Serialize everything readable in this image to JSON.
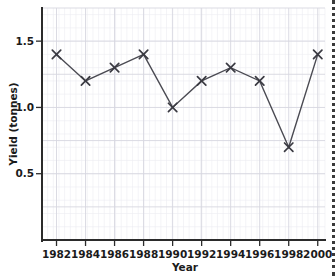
{
  "chart_data": {
    "type": "line",
    "title": "",
    "xlabel": "Year",
    "ylabel": "Yield (tonnes)",
    "x": [
      1982,
      1984,
      1986,
      1988,
      1990,
      1992,
      1994,
      1996,
      1998,
      2000
    ],
    "values": [
      1.4,
      1.2,
      1.3,
      1.4,
      1.0,
      1.2,
      1.3,
      1.2,
      0.7,
      1.4
    ],
    "xtick_labels": [
      "1982",
      "1984",
      "1986",
      "1988",
      "1990",
      "1992",
      "1994",
      "1996",
      "1998",
      "2000"
    ],
    "ytick_labels": [
      "0.5",
      "1.0",
      "1.5"
    ],
    "ytick_values": [
      0.5,
      1.0,
      1.5
    ],
    "xlim": [
      1981,
      2000.5
    ],
    "ylim": [
      0.0,
      1.75
    ],
    "grid": true,
    "minor_grid": true,
    "legend": false,
    "marker": "x",
    "line_color": "#4a4a52",
    "marker_color": "#3a3a42",
    "grid_color": "#d7d7e0",
    "minor_grid_color": "#ececf2",
    "axis_color": "#2b2b2b",
    "series": [
      {
        "name": "Yield",
        "points": [
          {
            "x": 1982,
            "y": 1.4
          },
          {
            "x": 1984,
            "y": 1.2
          },
          {
            "x": 1986,
            "y": 1.3
          },
          {
            "x": 1988,
            "y": 1.4
          },
          {
            "x": 1990,
            "y": 1.0
          },
          {
            "x": 1992,
            "y": 1.2
          },
          {
            "x": 1994,
            "y": 1.3
          },
          {
            "x": 1996,
            "y": 1.2
          },
          {
            "x": 1998,
            "y": 0.7
          },
          {
            "x": 2000,
            "y": 1.4
          }
        ]
      }
    ]
  },
  "axis": {
    "y_title": "Yield (tonnes)",
    "x_title": "Year",
    "y_labels": [
      "1.5",
      "1.0",
      "0.5"
    ],
    "x_labels": [
      "1982",
      "1984",
      "1986",
      "1988",
      "1990",
      "1992",
      "1994",
      "1996",
      "1998",
      "2000"
    ]
  }
}
